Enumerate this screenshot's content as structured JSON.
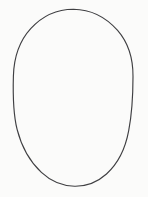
{
  "image": {
    "title": "Ellipse outline drawing",
    "width": 148,
    "height": 197,
    "background_color": "#fbfbfa",
    "alt_text": "A single thin dark outline of a tall vertical ellipse on a plain off-white background"
  },
  "shapes": [
    {
      "name": "ellipse-outline",
      "type": "ellipse",
      "stroke_color": "#3f3f42",
      "fill": "none",
      "stroke_width": 1.15,
      "center_x": 73,
      "center_y": 97.5,
      "radius_x": 60,
      "radius_y": 88.5,
      "bounds": {
        "left": 13,
        "top": 9,
        "right": 133,
        "bottom": 186
      },
      "path": "M 73.4 9.2 C 90.5 9.4 106.2 17.5 117.6 30.4 C 128.2 42.6 133.1 59.1 133.0 76.4 C 133.0 94.6 132.0 113.2 128.7 130.7 C 125.6 147.4 118.3 163.4 106.5 174.0 C 97.6 182.0 86.0 186.4 74.6 186.2 C 62.5 186.0 50.6 181.0 41.4 172.4 C 29.5 161.3 21.3 145.8 17.1 129.4 C 12.7 112.1 12.9 93.8 13.4 76.0 C 13.9 58.4 19.2 41.2 30.7 28.6 C 41.8 16.5 57.1 9.2 73.4 9.2 Z"
    }
  ],
  "text_content": []
}
